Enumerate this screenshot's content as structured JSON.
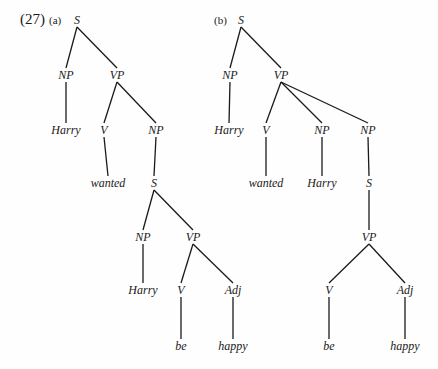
{
  "example_number": "(27)",
  "trees": [
    {
      "label": "(a)",
      "label_pos": [
        49,
        13
      ],
      "nodes": [
        {
          "id": "S",
          "text": "S",
          "x": 77,
          "y": 20
        },
        {
          "id": "NP1",
          "text": "NP",
          "x": 66,
          "y": 75
        },
        {
          "id": "VP1",
          "text": "VP",
          "x": 117,
          "y": 75
        },
        {
          "id": "Harry1",
          "text": "Harry",
          "x": 66,
          "y": 130
        },
        {
          "id": "V1",
          "text": "V",
          "x": 104,
          "y": 130
        },
        {
          "id": "NP2",
          "text": "NP",
          "x": 156,
          "y": 130
        },
        {
          "id": "wanted",
          "text": "wanted",
          "x": 108,
          "y": 183
        },
        {
          "id": "S2",
          "text": "S",
          "x": 154,
          "y": 183
        },
        {
          "id": "NP3",
          "text": "NP",
          "x": 143,
          "y": 237
        },
        {
          "id": "VP2",
          "text": "VP",
          "x": 193,
          "y": 237
        },
        {
          "id": "Harry2",
          "text": "Harry",
          "x": 143,
          "y": 290
        },
        {
          "id": "V2",
          "text": "V",
          "x": 181,
          "y": 290
        },
        {
          "id": "Adj",
          "text": "Adj",
          "x": 233,
          "y": 290
        },
        {
          "id": "be",
          "text": "be",
          "x": 181,
          "y": 346
        },
        {
          "id": "happy",
          "text": "happy",
          "x": 233,
          "y": 346
        }
      ],
      "edges": [
        [
          "S",
          "NP1"
        ],
        [
          "S",
          "VP1"
        ],
        [
          "NP1",
          "Harry1"
        ],
        [
          "VP1",
          "V1"
        ],
        [
          "VP1",
          "NP2"
        ],
        [
          "V1",
          "wanted"
        ],
        [
          "NP2",
          "S2"
        ],
        [
          "S2",
          "NP3"
        ],
        [
          "S2",
          "VP2"
        ],
        [
          "NP3",
          "Harry2"
        ],
        [
          "VP2",
          "V2"
        ],
        [
          "VP2",
          "Adj"
        ],
        [
          "V2",
          "be"
        ],
        [
          "Adj",
          "happy"
        ]
      ]
    },
    {
      "label": "(b)",
      "label_pos": [
        214,
        13
      ],
      "nodes": [
        {
          "id": "S",
          "text": "S",
          "x": 241,
          "y": 20
        },
        {
          "id": "NP1",
          "text": "NP",
          "x": 230,
          "y": 75
        },
        {
          "id": "VP1",
          "text": "VP",
          "x": 281,
          "y": 75
        },
        {
          "id": "Harry1",
          "text": "Harry",
          "x": 229,
          "y": 130
        },
        {
          "id": "V1",
          "text": "V",
          "x": 266,
          "y": 130
        },
        {
          "id": "NP2",
          "text": "NP",
          "x": 322,
          "y": 130
        },
        {
          "id": "NP3",
          "text": "NP",
          "x": 368,
          "y": 130
        },
        {
          "id": "wanted",
          "text": "wanted",
          "x": 266,
          "y": 183
        },
        {
          "id": "Harry2",
          "text": "Harry",
          "x": 322,
          "y": 183
        },
        {
          "id": "S2",
          "text": "S",
          "x": 369,
          "y": 183
        },
        {
          "id": "VP2",
          "text": "VP",
          "x": 369,
          "y": 237
        },
        {
          "id": "V2",
          "text": "V",
          "x": 329,
          "y": 290
        },
        {
          "id": "Adj",
          "text": "Adj",
          "x": 405,
          "y": 290
        },
        {
          "id": "be",
          "text": "be",
          "x": 329,
          "y": 346
        },
        {
          "id": "happy",
          "text": "happy",
          "x": 405,
          "y": 346
        }
      ],
      "edges": [
        [
          "S",
          "NP1"
        ],
        [
          "S",
          "VP1"
        ],
        [
          "NP1",
          "Harry1"
        ],
        [
          "VP1",
          "V1"
        ],
        [
          "VP1",
          "NP2"
        ],
        [
          "VP1",
          "NP3"
        ],
        [
          "V1",
          "wanted"
        ],
        [
          "NP2",
          "Harry2"
        ],
        [
          "NP3",
          "S2"
        ],
        [
          "S2",
          "VP2"
        ],
        [
          "VP2",
          "V2"
        ],
        [
          "VP2",
          "Adj"
        ],
        [
          "V2",
          "be"
        ],
        [
          "Adj",
          "happy"
        ]
      ]
    }
  ]
}
